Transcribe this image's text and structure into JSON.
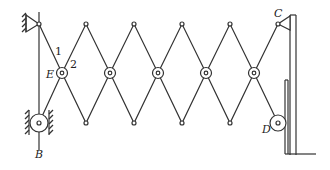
{
  "diagram": {
    "type": "scissor linkage mechanism",
    "labels": {
      "link1": "1",
      "link2": "2",
      "E": "E",
      "B": "B",
      "C": "C",
      "D": "D"
    },
    "colors": {
      "stroke": "#333333",
      "background": "#ffffff"
    },
    "pantograph_cells": 5
  }
}
